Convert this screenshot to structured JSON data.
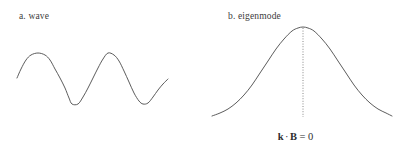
{
  "figure": {
    "width": 394,
    "height": 159,
    "background_color": "#ffffff",
    "stroke_color": "#4a4a4a",
    "text_color": "#3c3c3c"
  },
  "panels": [
    {
      "id": "a",
      "label": "a. wave",
      "curve_type": "sine wave"
    },
    {
      "id": "b",
      "label": "b. eigenmode",
      "curve_type": "gaussian bell curve",
      "guide_line": "dotted vertical line at peak"
    }
  ],
  "equation": {
    "vector_k": "k",
    "dot_operator": "·",
    "vector_B": "B",
    "relation": "=",
    "value": "0",
    "plain": "k · B = 0"
  },
  "chart_data": {
    "type": "line",
    "title": "",
    "panels": [
      {
        "name": "a. wave",
        "function": "sine",
        "xlabel": "",
        "ylabel": "",
        "xlim": [
          17,
          168
        ],
        "ylim": [
          53,
          104
        ],
        "baseline_y": 78,
        "amplitude": 26,
        "period": 70,
        "peaks_x": [
          38,
          108
        ],
        "troughs_x": [
          72,
          142
        ],
        "points": [
          [
            17,
            78
          ],
          [
            21,
            69
          ],
          [
            26,
            60
          ],
          [
            31,
            55
          ],
          [
            38,
            53
          ],
          [
            45,
            55
          ],
          [
            50,
            60
          ],
          [
            55,
            69
          ],
          [
            60,
            78
          ],
          [
            65,
            88
          ],
          [
            69,
            98
          ],
          [
            72,
            104
          ],
          [
            78,
            104
          ],
          [
            83,
            97
          ],
          [
            88,
            88
          ],
          [
            93,
            78
          ],
          [
            98,
            68
          ],
          [
            103,
            59
          ],
          [
            108,
            53
          ],
          [
            114,
            55
          ],
          [
            119,
            61
          ],
          [
            124,
            71
          ],
          [
            129,
            82
          ],
          [
            134,
            93
          ],
          [
            139,
            101
          ],
          [
            143,
            104
          ],
          [
            148,
            103
          ],
          [
            153,
            97
          ],
          [
            158,
            90
          ],
          [
            163,
            84
          ],
          [
            168,
            79
          ]
        ]
      },
      {
        "name": "b. eigenmode",
        "function": "gaussian",
        "xlabel": "",
        "ylabel": "",
        "xlim": [
          212,
          392
        ],
        "ylim": [
          27,
          116
        ],
        "baseline_y": 116,
        "peak_x": 303,
        "peak_y": 27,
        "sigma": 33,
        "guide_line_x": 303,
        "guide_line_y_top": 28,
        "guide_line_y_bottom": 117,
        "points": [
          [
            212,
            116
          ],
          [
            220,
            113
          ],
          [
            228,
            109
          ],
          [
            236,
            103
          ],
          [
            244,
            95
          ],
          [
            252,
            85
          ],
          [
            260,
            73
          ],
          [
            268,
            61
          ],
          [
            276,
            49
          ],
          [
            284,
            39
          ],
          [
            292,
            31
          ],
          [
            298,
            28
          ],
          [
            303,
            27
          ],
          [
            308,
            28
          ],
          [
            314,
            31
          ],
          [
            322,
            39
          ],
          [
            330,
            49
          ],
          [
            338,
            61
          ],
          [
            346,
            73
          ],
          [
            354,
            85
          ],
          [
            362,
            95
          ],
          [
            370,
            103
          ],
          [
            378,
            109
          ],
          [
            386,
            113
          ],
          [
            392,
            116
          ]
        ]
      }
    ],
    "grid": false,
    "legend": "none",
    "annotations": [
      "k · B = 0"
    ]
  }
}
